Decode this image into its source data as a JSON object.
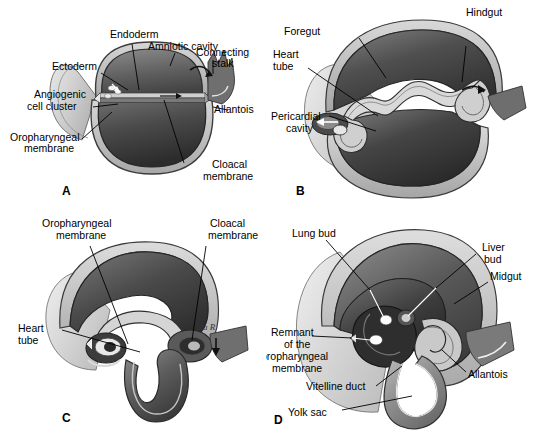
{
  "figure": {
    "background_color": "#ffffff",
    "ink_color": "#000000",
    "leader_line_color_dark": "#000000",
    "leader_line_color_light": "#ffffff",
    "signature": "ala R"
  },
  "panels": [
    {
      "letter": "A",
      "name": "panel-a",
      "labels": [
        {
          "id": "ectoderm",
          "text": "Ectoderm"
        },
        {
          "id": "endoderm",
          "text": "Endoderm"
        },
        {
          "id": "amniotic-cavity",
          "text": "Amniotic cavity"
        },
        {
          "id": "connecting-stalk",
          "text": "Connecting",
          "text2": "stalk"
        },
        {
          "id": "allantois",
          "text": "Allantois"
        },
        {
          "id": "angiogenic-cell-cluster",
          "text": "Angiogenic",
          "text2": "cell cluster"
        },
        {
          "id": "oropharyngeal-membrane",
          "text": "Oropharyngeal",
          "text2": "membrane"
        },
        {
          "id": "cloacal-membrane",
          "text": "Cloacal",
          "text2": "membrane"
        }
      ]
    },
    {
      "letter": "B",
      "name": "panel-b",
      "labels": [
        {
          "id": "foregut",
          "text": "Foregut"
        },
        {
          "id": "hindgut",
          "text": "Hindgut"
        },
        {
          "id": "heart-tube",
          "text": "Heart",
          "text2": "tube"
        },
        {
          "id": "pericardial-cavity",
          "text": "Pericardial",
          "text2": "cavity"
        }
      ]
    },
    {
      "letter": "C",
      "name": "panel-c",
      "labels": [
        {
          "id": "oropharyngeal-membrane",
          "text": "Oropharyngeal",
          "text2": "membrane"
        },
        {
          "id": "cloacal-membrane",
          "text": "Cloacal",
          "text2": "membrane"
        },
        {
          "id": "heart-tube",
          "text": "Heart",
          "text2": "tube"
        }
      ]
    },
    {
      "letter": "D",
      "name": "panel-d",
      "labels": [
        {
          "id": "lung-bud",
          "text": "Lung bud"
        },
        {
          "id": "liver-bud",
          "text": "Liver",
          "text2": "bud"
        },
        {
          "id": "midgut",
          "text": "Midgut"
        },
        {
          "id": "remnant-oropharyngeal-membrane",
          "text": "Remnant",
          "text2": "of the",
          "text3": "oropharyngeal",
          "text4": "membrane"
        },
        {
          "id": "allantois",
          "text": "Allantois"
        },
        {
          "id": "vitelline-duct",
          "text": "Vitelline duct"
        },
        {
          "id": "yolk-sac",
          "text": "Yolk sac"
        }
      ]
    }
  ]
}
